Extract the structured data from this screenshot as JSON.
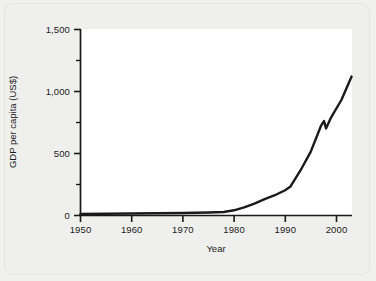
{
  "chart_data": {
    "type": "line",
    "title": "",
    "xlabel": "Year",
    "ylabel": "GDP per capita (US$)",
    "xlim": [
      1950,
      2003
    ],
    "ylim": [
      0,
      1500
    ],
    "grid": false,
    "legend": null,
    "x_ticks": [
      1950,
      1960,
      1970,
      1980,
      1990,
      2000
    ],
    "x_tick_labels": [
      "1950",
      "1960",
      "1970",
      "1980",
      "1990",
      "2000"
    ],
    "x_minor_ticks": [
      1955,
      1965,
      1975,
      1985,
      1995
    ],
    "y_ticks": [
      0,
      500,
      1000,
      1500
    ],
    "y_tick_labels": [
      "0",
      "500",
      "1,000",
      "1,500"
    ],
    "y_minor_ticks": [
      250,
      750,
      1250
    ],
    "line_color": "#1a1a1a",
    "line_width": 2.4,
    "series": [
      {
        "name": "GDP per capita (US$)",
        "x": [
          1950,
          1955,
          1960,
          1965,
          1970,
          1975,
          1978,
          1980,
          1982,
          1984,
          1986,
          1988,
          1990,
          1991,
          1993,
          1995,
          1997,
          1997.6,
          1998,
          1999,
          2001,
          2003
        ],
        "values": [
          8,
          10,
          12,
          14,
          16,
          20,
          24,
          38,
          62,
          92,
          128,
          160,
          200,
          228,
          360,
          510,
          720,
          760,
          700,
          790,
          930,
          1120
        ]
      }
    ]
  },
  "axes": {
    "y_labels": [
      "1,500",
      "1,000",
      "500",
      "0"
    ],
    "x_labels": [
      "1950",
      "1960",
      "1970",
      "1980",
      "1990",
      "2000"
    ],
    "y_title": "GDP per capita (US$)",
    "x_title": "Year"
  },
  "colors": {
    "background": "#efefee",
    "plot_background": "#ffffff",
    "axis": "#1a1a1a",
    "line": "#1a1a1a",
    "text": "#1b1b1b"
  }
}
